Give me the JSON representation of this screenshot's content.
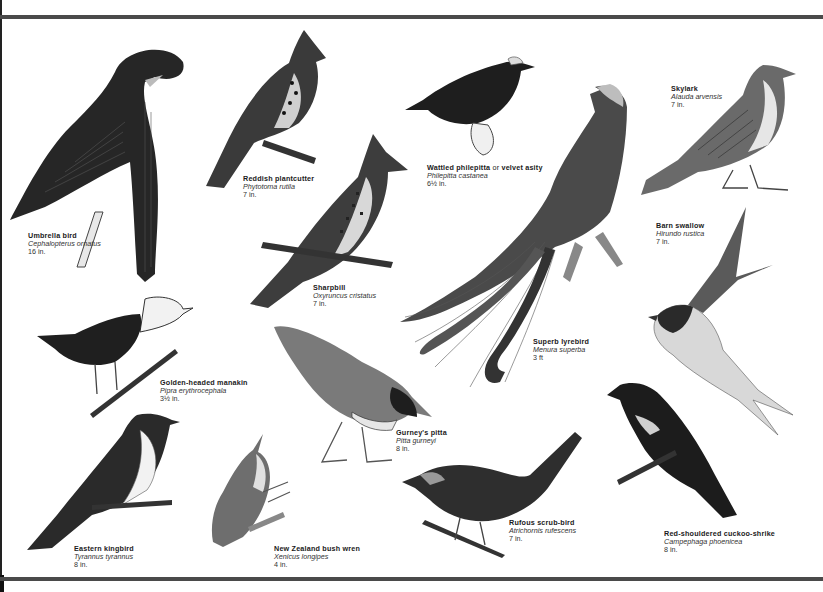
{
  "plate": {
    "colors": {
      "ink": "#1a1a1a",
      "rule": "#4a4a4a",
      "paper": "#ffffff"
    },
    "birds": [
      {
        "id": "umbrella-bird",
        "common": "Umbrella bird",
        "scientific": "Cephalopterus ornatus",
        "size": "16 in."
      },
      {
        "id": "reddish-plantcutter",
        "common": "Reddish plantcutter",
        "scientific": "Phytotoma rutila",
        "size": "7 in."
      },
      {
        "id": "wattled-philepitta",
        "common": "Wattled philepitta",
        "common_connector": "or",
        "common_alt": "velvet asity",
        "scientific": "Philepitta castanea",
        "size": "6½ in."
      },
      {
        "id": "skylark",
        "common": "Skylark",
        "scientific": "Alauda arvensis",
        "size": "7 in."
      },
      {
        "id": "barn-swallow",
        "common": "Barn swallow",
        "scientific": "Hirundo rustica",
        "size": "7 in."
      },
      {
        "id": "sharpbill",
        "common": "Sharpbill",
        "scientific": "Oxyruncus cristatus",
        "size": "7 in."
      },
      {
        "id": "superb-lyrebird",
        "common": "Superb lyrebird",
        "scientific": "Menura superba",
        "size": "3 ft"
      },
      {
        "id": "golden-headed-manakin",
        "common": "Golden-headed manakin",
        "scientific": "Pipra erythrocephala",
        "size": "3½ in."
      },
      {
        "id": "gurneys-pitta",
        "common": "Gurney's pitta",
        "scientific": "Pitta gurneyi",
        "size": "8 in."
      },
      {
        "id": "rufous-scrub-bird",
        "common": "Rufous scrub-bird",
        "scientific": "Atrichornis rufescens",
        "size": "7 in."
      },
      {
        "id": "red-shouldered-cuckoo-shrike",
        "common": "Red-shouldered cuckoo-shrike",
        "scientific": "Campephaga phoenicea",
        "size": "8 in."
      },
      {
        "id": "eastern-kingbird",
        "common": "Eastern kingbird",
        "scientific": "Tyrannus tyrannus",
        "size": "8 in."
      },
      {
        "id": "new-zealand-bush-wren",
        "common": "New Zealand bush wren",
        "scientific": "Xenicus longipes",
        "size": "4 in."
      }
    ]
  }
}
